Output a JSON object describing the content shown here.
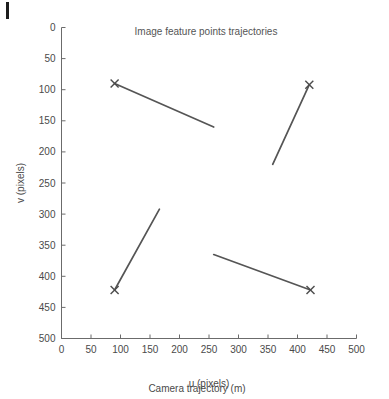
{
  "figure": {
    "caption": "Camera trajectory (m)",
    "edge_mark": "page-edge-artifact"
  },
  "chart_data": {
    "type": "line",
    "title": "Image feature points trajectories",
    "xlabel": "u (pixels)",
    "ylabel": "v (pixels)",
    "xlim": [
      0,
      500
    ],
    "ylim": [
      0,
      500
    ],
    "y_inverted": true,
    "grid": false,
    "legend": null,
    "xticks": [
      0,
      50,
      100,
      150,
      200,
      250,
      300,
      350,
      400,
      450,
      500
    ],
    "yticks": [
      0,
      50,
      100,
      150,
      200,
      250,
      300,
      350,
      400,
      450,
      500
    ],
    "line_color": "#555555",
    "marker_color": "#4c4c4c",
    "marker_symbol": "x",
    "series": [
      {
        "name": "trajectory-top-left",
        "x": [
          90,
          258
        ],
        "y": [
          90,
          160
        ],
        "marker_at": "start",
        "marker_x": 90,
        "marker_y": 90
      },
      {
        "name": "trajectory-top-right",
        "x": [
          358,
          420
        ],
        "y": [
          220,
          92
        ],
        "marker_at": "end",
        "marker_x": 420,
        "marker_y": 92
      },
      {
        "name": "trajectory-bottom-left",
        "x": [
          90,
          166
        ],
        "y": [
          422,
          292
        ],
        "marker_at": "start",
        "marker_x": 90,
        "marker_y": 422
      },
      {
        "name": "trajectory-bottom-right",
        "x": [
          258,
          422
        ],
        "y": [
          365,
          422
        ],
        "marker_at": "end",
        "marker_x": 422,
        "marker_y": 422
      }
    ]
  }
}
